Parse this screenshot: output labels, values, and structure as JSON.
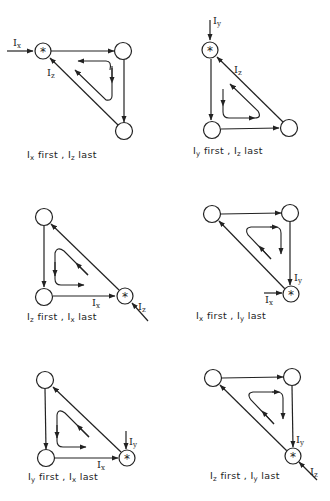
{
  "figure": {
    "panels": [
      {
        "id": "p1",
        "caption": {
          "first_sym": "I",
          "first_sub": "x",
          "mid": " first , ",
          "last_sym": "I",
          "last_sub": "z",
          "end": " last"
        },
        "input_label": {
          "sym": "I",
          "sub": "x"
        },
        "other_label": {
          "sym": "I",
          "sub": "z"
        }
      },
      {
        "id": "p2",
        "caption": {
          "first_sym": "I",
          "first_sub": "y",
          "mid": " first , ",
          "last_sym": "I",
          "last_sub": "z",
          "end": " last"
        },
        "input_label": {
          "sym": "I",
          "sub": "y"
        },
        "other_label": {
          "sym": "I",
          "sub": "z"
        }
      },
      {
        "id": "p3",
        "caption": {
          "first_sym": "I",
          "first_sub": "z",
          "mid": " first , ",
          "last_sym": "I",
          "last_sub": "x",
          "end": " last"
        },
        "input_label": {
          "sym": "I",
          "sub": "z"
        },
        "other_label": {
          "sym": "I",
          "sub": "x"
        }
      },
      {
        "id": "p4",
        "caption": {
          "first_sym": "I",
          "first_sub": "x",
          "mid": " first , ",
          "last_sym": "I",
          "last_sub": "y",
          "end": " last"
        },
        "input_label": {
          "sym": "I",
          "sub": "x"
        },
        "other_label": {
          "sym": "I",
          "sub": "y"
        }
      },
      {
        "id": "p5",
        "caption": {
          "first_sym": "I",
          "first_sub": "y",
          "mid": " first , ",
          "last_sym": "I",
          "last_sub": "x",
          "end": " last"
        },
        "input_label": {
          "sym": "I",
          "sub": "y"
        },
        "other_label": {
          "sym": "I",
          "sub": "x"
        }
      },
      {
        "id": "p6",
        "caption": {
          "first_sym": "I",
          "first_sub": "z",
          "mid": " first , ",
          "last_sym": "I",
          "last_sub": "y",
          "end": " last"
        },
        "input_label": {
          "sym": "I",
          "sub": "z"
        },
        "other_label": {
          "sym": "I",
          "sub": "y"
        }
      }
    ],
    "start_marker": "*"
  }
}
